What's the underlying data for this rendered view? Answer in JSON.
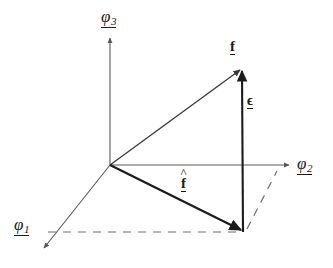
{
  "figure": {
    "type": "vector-diagram",
    "background_color": "#ffffff",
    "axis_color": "#58585a",
    "vector_color": "#1c1c1c",
    "dashed_color": "#6e6e70",
    "text_color": "#1a1a1a",
    "axes": [
      {
        "id": "phi1",
        "label": "φ",
        "subscript": "1",
        "underbarred": true,
        "direction": "down-left",
        "origin": [
          110,
          165
        ],
        "tip": [
          42,
          250
        ],
        "arrow": true
      },
      {
        "id": "phi2",
        "label": "φ",
        "subscript": "2",
        "underbarred": true,
        "direction": "right",
        "origin": [
          110,
          165
        ],
        "tip": [
          292,
          165
        ],
        "arrow": true
      },
      {
        "id": "phi3",
        "label": "φ",
        "subscript": "3",
        "underbarred": true,
        "direction": "up",
        "origin": [
          110,
          165
        ],
        "tip": [
          110,
          37
        ],
        "arrow": true
      }
    ],
    "vectors": [
      {
        "id": "f",
        "label": "f",
        "hat": false,
        "underbarred": true,
        "bold": true,
        "from": [
          110,
          165
        ],
        "to": [
          242,
          68
        ],
        "arrow": true,
        "description": "full vector f from origin to point above the plane"
      },
      {
        "id": "f-hat",
        "label": "f",
        "hat": true,
        "underbarred": true,
        "bold": true,
        "from": [
          110,
          165
        ],
        "to": [
          243,
          232
        ],
        "arrow": true,
        "description": "projection f-hat from origin onto the plane"
      },
      {
        "id": "epsilon",
        "label": "ϵ",
        "hat": false,
        "underbarred": true,
        "bold": true,
        "from": [
          243,
          232
        ],
        "to": [
          242,
          68
        ],
        "arrow": true,
        "description": "error vector epsilon joining f-hat tip to f tip"
      }
    ],
    "dashed_lines": [
      {
        "id": "dashed-horizontal",
        "from": [
          48,
          232
        ],
        "to": [
          240,
          232
        ],
        "description": "horizontal construction line parallel to phi2 through f-hat tip"
      },
      {
        "id": "dashed-diagonal",
        "from": [
          246,
          230
        ],
        "to": [
          277,
          171
        ],
        "description": "construction line from f-hat tip toward phi2 axis"
      }
    ]
  }
}
